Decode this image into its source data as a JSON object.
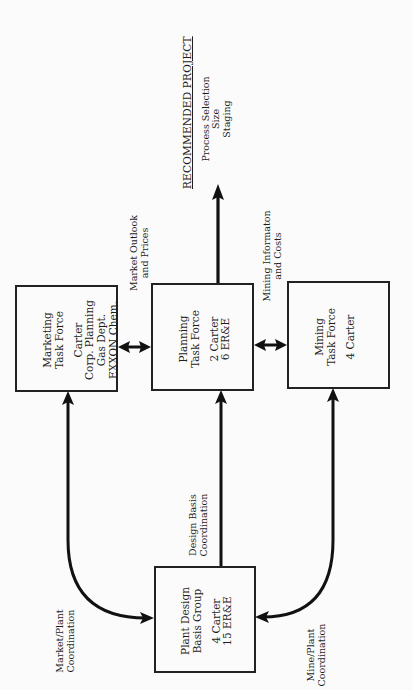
{
  "diagram": {
    "nodes": {
      "marketing": {
        "title": [
          "Marketing",
          "Task Force"
        ],
        "members": [
          "Carter",
          "Corp. Planning",
          "Gas Dept.",
          "EXXON Chem."
        ]
      },
      "planning": {
        "title": [
          "Planning",
          "Task Force"
        ],
        "members": [
          "2 Carter",
          "6 ER&E"
        ]
      },
      "mining": {
        "title": [
          "Mining",
          "Task Force"
        ],
        "members": [
          "4 Carter"
        ]
      },
      "plant_design": {
        "title": [
          "Plant Design",
          "Basis Group"
        ],
        "members": [
          "4 Carter",
          "15 ER&E"
        ]
      }
    },
    "edges": {
      "market_outlook": [
        "Market Outlook",
        "and Prices"
      ],
      "mining_info": [
        "Mining Informaton",
        "and Costs"
      ],
      "design_basis": [
        "Design Basis",
        "Coordination"
      ],
      "market_plant": [
        "Market/Plant",
        "Coordination"
      ],
      "mine_plant": [
        "Mine/Plant",
        "Coordination"
      ]
    },
    "output": {
      "title": "RECOMMENDED PROJECT",
      "items": [
        "Process Selection",
        "Size",
        "Staging"
      ]
    },
    "colors": {
      "line": "#111111",
      "background": "#fbfbfb"
    }
  }
}
